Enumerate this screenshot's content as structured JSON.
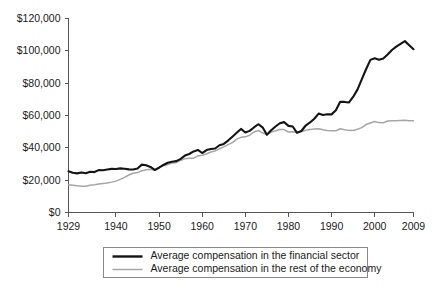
{
  "chart_data": {
    "type": "line",
    "title": "",
    "subtitle": "",
    "xlabel": "",
    "ylabel": "",
    "xlim": [
      1929,
      2009
    ],
    "ylim": [
      0,
      120000
    ],
    "grid": false,
    "legend_position": "bottom",
    "x_ticks": [
      1929,
      1940,
      1950,
      1960,
      1970,
      1980,
      1990,
      2000,
      2009
    ],
    "x_tick_labels": [
      "1929",
      "1940",
      "1950",
      "1960",
      "1970",
      "1980",
      "1990",
      "2000",
      "2009"
    ],
    "y_ticks": [
      0,
      20000,
      40000,
      60000,
      80000,
      100000,
      120000
    ],
    "y_tick_labels": [
      "$0",
      "$20,000",
      "$40,000",
      "$60,000",
      "$80,000",
      "$100,000",
      "$120,000"
    ],
    "x": [
      1929,
      1930,
      1931,
      1932,
      1933,
      1934,
      1935,
      1936,
      1937,
      1938,
      1939,
      1940,
      1941,
      1942,
      1943,
      1944,
      1945,
      1946,
      1947,
      1948,
      1949,
      1950,
      1951,
      1952,
      1953,
      1954,
      1955,
      1956,
      1957,
      1958,
      1959,
      1960,
      1961,
      1962,
      1963,
      1964,
      1965,
      1966,
      1967,
      1968,
      1969,
      1970,
      1971,
      1972,
      1973,
      1974,
      1975,
      1976,
      1977,
      1978,
      1979,
      1980,
      1981,
      1982,
      1983,
      1984,
      1985,
      1986,
      1987,
      1988,
      1989,
      1990,
      1991,
      1992,
      1993,
      1994,
      1995,
      1996,
      1997,
      1998,
      1999,
      2000,
      2001,
      2002,
      2003,
      2004,
      2005,
      2006,
      2007,
      2008,
      2009
    ],
    "series": [
      {
        "name": "Average compensation in the financial sector",
        "color": "#141414",
        "width": 2.1,
        "values": [
          25500,
          24600,
          24200,
          24800,
          24300,
          25200,
          25000,
          26200,
          26100,
          26600,
          27000,
          26900,
          27300,
          27100,
          26700,
          26600,
          27200,
          29600,
          29200,
          28200,
          26300,
          27700,
          29400,
          30800,
          31400,
          31800,
          33200,
          35200,
          36200,
          37800,
          38700,
          36800,
          38600,
          39300,
          39600,
          41600,
          42400,
          44500,
          46900,
          49300,
          51700,
          49500,
          50500,
          52600,
          54600,
          52700,
          48100,
          50900,
          53200,
          55200,
          55900,
          53600,
          53200,
          49300,
          50400,
          53800,
          55700,
          58000,
          61200,
          60300,
          60800,
          60700,
          63200,
          68500,
          68400,
          68000,
          71500,
          76000,
          82400,
          88600,
          94400,
          95400,
          94500,
          95300,
          97700,
          100500,
          102600,
          104300,
          106000,
          103500,
          101000
        ]
      },
      {
        "name": "Average compensation in the rest of the economy",
        "color": "#a6a6a6",
        "width": 1.5,
        "values": [
          17200,
          16900,
          16500,
          16200,
          16300,
          16900,
          17200,
          17600,
          18000,
          18200,
          18800,
          19400,
          20500,
          21700,
          23200,
          24300,
          24700,
          25800,
          26400,
          26700,
          26100,
          27900,
          28900,
          29700,
          30600,
          30800,
          32200,
          33300,
          33500,
          33600,
          35000,
          35400,
          36200,
          37400,
          38100,
          39400,
          40600,
          42000,
          43200,
          45400,
          46500,
          46800,
          47800,
          49800,
          50700,
          49300,
          48200,
          49700,
          50600,
          51300,
          51300,
          49800,
          49900,
          49500,
          50100,
          50900,
          51400,
          51600,
          51800,
          51200,
          50700,
          50600,
          50600,
          51800,
          51200,
          50800,
          50700,
          51500,
          52500,
          54400,
          55400,
          56300,
          55600,
          55500,
          56600,
          56800,
          56800,
          56900,
          57000,
          56800,
          56700
        ]
      }
    ]
  },
  "legend": {
    "items": [
      {
        "label": "Average compensation in the financial sector",
        "swatch": "line-black-thick"
      },
      {
        "label": "Average compensation in the rest of the economy",
        "swatch": "line-gray-thin"
      }
    ]
  },
  "colors": {
    "financial": "#141414",
    "rest": "#a6a6a6",
    "axis": "#555555",
    "text": "#1a1a1a",
    "background": "#ffffff"
  }
}
